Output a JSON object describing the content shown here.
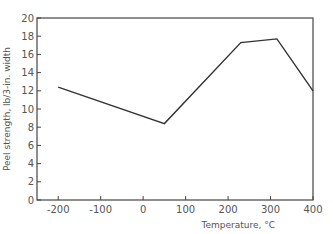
{
  "chart_data": {
    "type": "line",
    "title": "",
    "xlabel": "Temperature, °C",
    "ylabel": "Peel strength, lb/3-in. width",
    "xlim": [
      -250,
      400
    ],
    "ylim": [
      0,
      20
    ],
    "x_ticks": [
      -200,
      -100,
      0,
      100,
      200,
      300,
      400
    ],
    "x_tick_labels": [
      "-200",
      "-100",
      "0",
      "100",
      "200",
      "300",
      "400"
    ],
    "y_ticks": [
      0,
      2,
      4,
      6,
      8,
      10,
      12,
      14,
      16,
      18,
      20
    ],
    "y_tick_labels": [
      "0",
      "2",
      "4",
      "6",
      "8",
      "10",
      "12",
      "14",
      "16",
      "18",
      "20"
    ],
    "grid": false,
    "legend": null,
    "series": [
      {
        "name": "Peel strength",
        "x": [
          -200,
          50,
          230,
          315,
          400
        ],
        "y": [
          12.4,
          8.4,
          17.3,
          17.7,
          12.0
        ]
      }
    ],
    "line_color": "#333333",
    "axis_color": "#444444"
  }
}
